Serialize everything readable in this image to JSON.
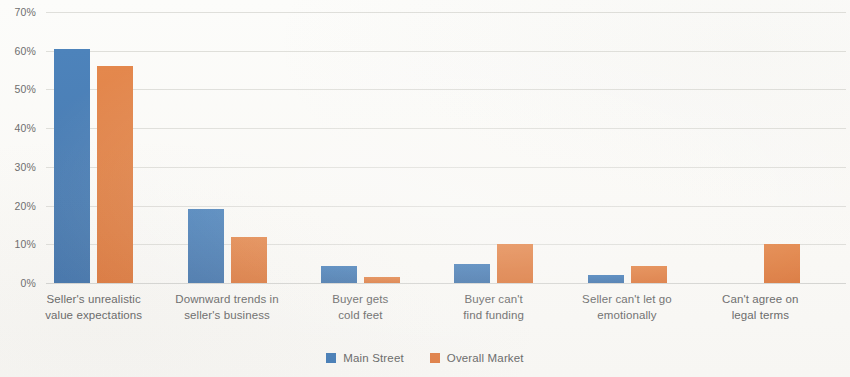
{
  "chart_data": {
    "type": "bar",
    "title": "",
    "subtitle": "",
    "xlabel": "",
    "ylabel": "",
    "ylim": [
      0,
      70
    ],
    "ytick_labels": [
      "0%",
      "10%",
      "20%",
      "30%",
      "40%",
      "50%",
      "60%",
      "70%"
    ],
    "ytick_values": [
      0,
      10,
      20,
      30,
      40,
      50,
      60,
      70
    ],
    "grid": true,
    "legend_position": "bottom-center",
    "value_unit": "%",
    "categories": [
      "Seller's unrealistic value expectations",
      "Downward trends in seller's business",
      "Buyer gets cold feet",
      "Buyer can't find funding",
      "Seller can't let go emotionally",
      "Can't agree on legal terms"
    ],
    "category_lines": [
      [
        "Seller's unrealistic",
        "value expectations"
      ],
      [
        "Downward trends in",
        "seller's business"
      ],
      [
        "Buyer gets",
        "cold feet"
      ],
      [
        "Buyer can't",
        "find funding"
      ],
      [
        "Seller can't let go",
        "emotionally"
      ],
      [
        "Can't agree on",
        "legal terms"
      ]
    ],
    "series": [
      {
        "name": "Main Street",
        "color": "#4a80b8",
        "values": [
          60.5,
          19,
          4.5,
          5,
          2,
          0
        ]
      },
      {
        "name": "Overall Market",
        "color": "#e0824a",
        "values": [
          56,
          12,
          1.5,
          10,
          4.5,
          10
        ]
      }
    ]
  },
  "legend": {
    "items": [
      {
        "label": "Main Street",
        "color": "#4a80b8",
        "key": "main-street"
      },
      {
        "label": "Overall Market",
        "color": "#e0824a",
        "key": "overall-market"
      }
    ]
  },
  "colors": {
    "main_street": "#4a80b8",
    "overall_market": "#e0824a",
    "gridline": "#d9d9d5",
    "axis_text": "#6a6a6a",
    "background": "#fbfbf9"
  }
}
